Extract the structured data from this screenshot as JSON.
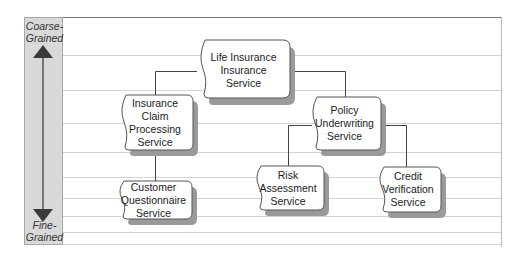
{
  "diagram": {
    "scale": {
      "top_label": "Coarse-\nGrained",
      "top_label_lines": [
        "Coarse-",
        "Grained"
      ],
      "bottom_label_lines": [
        "Fine-",
        "Grained"
      ],
      "arrow": "double-headed-vertical-arrow"
    },
    "colors": {
      "scale_bar_fill": "#d9d9d9",
      "node_fill": "#ffffff",
      "node_border": "#555555",
      "node_shadow": "#9a9a9a",
      "connector": "#444444",
      "gridline": "#d4d4d4"
    },
    "nodes": [
      {
        "id": "life",
        "lines": [
          "Life Insurance",
          "Insurance",
          "Service"
        ]
      },
      {
        "id": "claim",
        "lines": [
          "Insurance",
          "Claim",
          "Processing",
          "Service"
        ]
      },
      {
        "id": "policy",
        "lines": [
          "Policy",
          "Underwriting",
          "Service"
        ]
      },
      {
        "id": "customer",
        "lines": [
          "Customer",
          "Questionnaire",
          "Service"
        ]
      },
      {
        "id": "risk",
        "lines": [
          "Risk",
          "Assessment",
          "Service"
        ]
      },
      {
        "id": "credit",
        "lines": [
          "Credit",
          "Verification",
          "Service"
        ]
      }
    ],
    "edges": [
      {
        "from": "life",
        "to": "claim"
      },
      {
        "from": "life",
        "to": "policy"
      },
      {
        "from": "claim",
        "to": "customer"
      },
      {
        "from": "policy",
        "to": "risk"
      },
      {
        "from": "policy",
        "to": "credit"
      }
    ]
  }
}
